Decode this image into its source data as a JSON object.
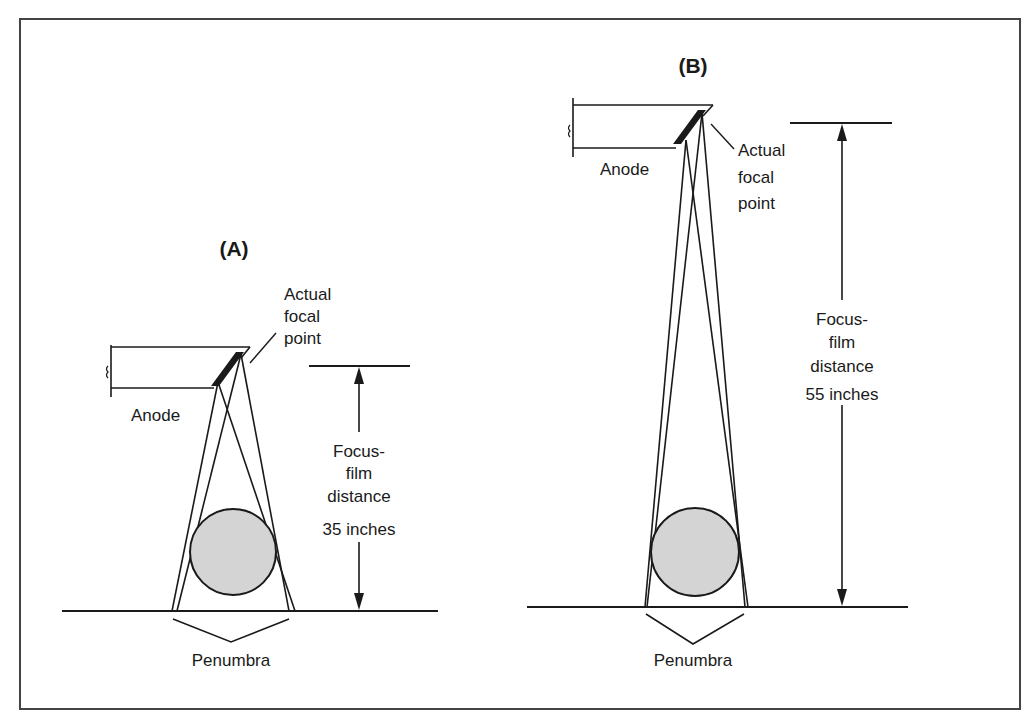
{
  "figure": {
    "panel_a": {
      "title": "(A)",
      "anode_label": "Anode",
      "focal_label": [
        "Actual",
        "focal",
        "point"
      ],
      "distance_label": [
        "Focus-",
        "film",
        "distance",
        "35 inches"
      ],
      "penumbra_label": "Penumbra",
      "focus_film_distance_inches": 35
    },
    "panel_b": {
      "title": "(B)",
      "anode_label": "Anode",
      "focal_label": [
        "Actual",
        "focal",
        "point"
      ],
      "distance_label": [
        "Focus-",
        "film",
        "distance",
        "55 inches"
      ],
      "penumbra_label": "Penumbra",
      "focus_film_distance_inches": 55
    },
    "colors": {
      "line": "#1a1a1a",
      "object_fill": "#d4d4d4",
      "background": "#ffffff"
    }
  }
}
